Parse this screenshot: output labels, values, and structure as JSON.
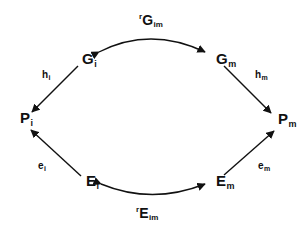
{
  "diagram": {
    "type": "commutative-diagram",
    "background_color": "#ffffff",
    "stroke_color": "#111111",
    "nodes": [
      {
        "id": "G_i",
        "base": "G",
        "sub": "i",
        "x": 82,
        "y": 58
      },
      {
        "id": "G_m",
        "base": "G",
        "sub": "m",
        "x": 216,
        "y": 58
      },
      {
        "id": "P_i",
        "base": "P",
        "sub": "i",
        "x": 20,
        "y": 117
      },
      {
        "id": "P_m",
        "base": "P",
        "sub": "m",
        "x": 278,
        "y": 118
      },
      {
        "id": "E_i",
        "base": "E",
        "sub": "i",
        "x": 86,
        "y": 180
      },
      {
        "id": "E_m",
        "base": "E",
        "sub": "m",
        "x": 216,
        "y": 180
      }
    ],
    "edges": [
      {
        "id": "r_G_im",
        "from": "G_i",
        "to": "G_m",
        "style": "curved",
        "arrowheads": "both",
        "label_prefix": "r",
        "label_base": "G",
        "label_sub": "im",
        "label_x": 139,
        "label_y": 12
      },
      {
        "id": "r_E_im",
        "from": "E_i",
        "to": "E_m",
        "style": "curved",
        "arrowheads": "both",
        "label_prefix": "r",
        "label_base": "E",
        "label_sub": "im",
        "label_x": 136,
        "label_y": 205
      },
      {
        "id": "h_i",
        "from": "G_i",
        "to": "P_i",
        "style": "straight",
        "arrowheads": "end",
        "label_base": "h",
        "label_sub": "i",
        "label_x": 42,
        "label_y": 70
      },
      {
        "id": "h_m",
        "from": "G_m",
        "to": "P_m",
        "style": "straight",
        "arrowheads": "end",
        "label_base": "h",
        "label_sub": "m",
        "label_x": 255,
        "label_y": 70
      },
      {
        "id": "e_i",
        "from": "E_i",
        "to": "P_i",
        "style": "straight",
        "arrowheads": "end",
        "label_base": "e",
        "label_sub": "i",
        "label_x": 38,
        "label_y": 161
      },
      {
        "id": "e_m",
        "from": "E_m",
        "to": "P_m",
        "style": "straight",
        "arrowheads": "end",
        "label_base": "e",
        "label_sub": "m",
        "label_x": 258,
        "label_y": 161
      }
    ]
  }
}
